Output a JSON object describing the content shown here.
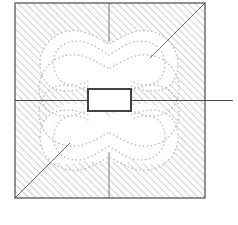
{
  "figure": {
    "type": "technical-cross-section-diagram",
    "background_color": "#ffffff",
    "ink_color": "#3a3a3a",
    "hatch_color": "#8f8f8f",
    "contour_color": "#b9b9b9",
    "rectangle_stroke_color": "#404040",
    "rectangle_fill_color": "#ffffff"
  },
  "geometry": {
    "outer_square": {
      "label": "outer-boundary-square",
      "x": 15,
      "y": 3,
      "width": 190,
      "height": 195,
      "stroke_width": 1.1
    },
    "inner_rectangle": {
      "label": "centre-rectangle",
      "x": 88,
      "y": 89,
      "width": 43,
      "height": 22,
      "stroke_width": 2.0
    },
    "horizontal_axis_line": {
      "label": "horizontal-axis",
      "x1": 15,
      "y1": 100.5,
      "x2": 233,
      "y2": 100.5,
      "stroke_width": 1.1
    },
    "top_centre_tick": {
      "label": "top-centre-tick",
      "x1": 109,
      "y1": 3,
      "x2": 109,
      "y2": 42,
      "stroke_width": 0.9
    },
    "bottom_centre_tick": {
      "label": "bottom-centre-tick",
      "x1": 109,
      "y1": 198,
      "x2": 109,
      "y2": 152,
      "stroke_width": 0.9
    },
    "diagonal_top_right": {
      "label": "diagonal-top-right",
      "x1": 205,
      "y1": 3,
      "x2": 150,
      "y2": 58,
      "stroke_width": 0.9
    },
    "diagonal_bottom_left": {
      "label": "diagonal-bottom-left",
      "x1": 15,
      "y1": 198,
      "x2": 70,
      "y2": 143,
      "stroke_width": 0.9
    },
    "hatching": {
      "label": "45-degree-hatching",
      "angle_degrees": 45,
      "direction": "lower-left-to-upper-right",
      "spacing_px": 5,
      "stroke_width": 0.85
    }
  },
  "chart_data": {
    "type": "contour",
    "title": "",
    "xlabel": "",
    "ylabel": "",
    "legend": [],
    "grid": false,
    "line_style": "dotted",
    "contour_count": 4,
    "contours": [
      {
        "name": "upper-outer-contour",
        "lobe": "upper",
        "level_index": 1,
        "points": "40,64 41,52 46,42 55,35 66,31 78,32 86,38 95,43 104,44 109,44 115,44 124,43 133,38 141,32 153,31 164,35 172,43 177,53 178,65 176,76 170,84 160,89 149,90 140,87 134,88 131,89 131,99 131,110 131,111 135,113 142,115 150,116 161,113 170,107 176,99 178,88 177,76 172,66 164,58 153,54 141,53 133,59 124,64 115,68 109,69 104,68 95,64 86,59 78,53 66,54 55,58 46,66 41,76 40,88 42,99 48,108 57,114 68,116 76,114 81,111 88,110 88,99 88,89 85,88 79,87 70,90 59,89 49,84 43,76"
      },
      {
        "name": "upper-inner-contour",
        "lobe": "upper",
        "level_index": 2,
        "points": "53,64 55,54 61,46 70,41 80,40 89,45 97,51 104,54 109,55 114,54 121,51 129,45 138,40 148,41 157,46 163,54 165,64 163,74 156,81 147,84 138,82 133,85 131,88 131,89 88,89 88,88 86,85 81,82 72,84 63,81 56,74"
      },
      {
        "name": "lower-outer-contour",
        "lobe": "lower",
        "level_index": 3,
        "points": "40,136 41,124 46,114 55,107 66,103 78,104 86,110 95,115 104,116 109,116 115,116 124,115 133,110 141,104 153,103 164,107 172,115 177,125 178,137 176,148 170,156 160,161 149,162 140,159 134,160 131,161 131,171 131,182 131,183 135,185 142,187 150,188 161,185 170,179 176,171 178,160 177,148 172,138 164,130 153,126 141,125 133,131 124,136 115,140 109,141 104,140 95,136 86,131 78,125 66,126 55,130 46,138 41,148 40,160"
      },
      {
        "name": "lower-inner-contour",
        "lobe": "lower",
        "level_index": 4,
        "points": "53,137 55,127 61,119 70,114 80,113 89,118 97,124 104,127 109,128 114,127 121,124 129,118 138,113 148,114 157,119 163,127 165,137 163,147 156,154 147,157 138,155 133,158 131,161"
      }
    ]
  }
}
